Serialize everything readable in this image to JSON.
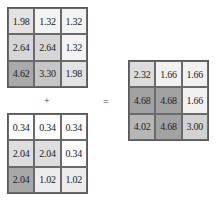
{
  "operands": {
    "plus": "+",
    "equals": "="
  },
  "matrix_a": {
    "rows": [
      [
        {
          "v": "1.98",
          "c": "#e3e3e3"
        },
        {
          "v": "1.32",
          "c": "#f3f3f3"
        },
        {
          "v": "1.32",
          "c": "#f3f3f3"
        }
      ],
      [
        {
          "v": "2.64",
          "c": "#d6d6d6"
        },
        {
          "v": "2.64",
          "c": "#d6d6d6"
        },
        {
          "v": "1.32",
          "c": "#f3f3f3"
        }
      ],
      [
        {
          "v": "4.62",
          "c": "#aaaaaa"
        },
        {
          "v": "3.30",
          "c": "#c6c6c6"
        },
        {
          "v": "1.98",
          "c": "#e3e3e3"
        }
      ]
    ]
  },
  "matrix_b": {
    "rows": [
      [
        {
          "v": "0.34",
          "c": "#fcfcfc"
        },
        {
          "v": "0.34",
          "c": "#fcfcfc"
        },
        {
          "v": "0.34",
          "c": "#fcfcfc"
        }
      ],
      [
        {
          "v": "2.04",
          "c": "#dedede"
        },
        {
          "v": "2.04",
          "c": "#dedede"
        },
        {
          "v": "0.34",
          "c": "#fcfcfc"
        }
      ],
      [
        {
          "v": "2.04",
          "c": "#a8a8a8"
        },
        {
          "v": "1.02",
          "c": "#ececec"
        },
        {
          "v": "1.02",
          "c": "#ececec"
        }
      ]
    ]
  },
  "matrix_sum": {
    "rows": [
      [
        {
          "v": "2.32",
          "c": "#dcdcdc"
        },
        {
          "v": "1.66",
          "c": "#f1f1f1"
        },
        {
          "v": "1.66",
          "c": "#f1f1f1"
        }
      ],
      [
        {
          "v": "4.68",
          "c": "#a2a2a2"
        },
        {
          "v": "4.68",
          "c": "#a2a2a2"
        },
        {
          "v": "1.66",
          "c": "#f1f1f1"
        }
      ],
      [
        {
          "v": "4.02",
          "c": "#b6b6b6"
        },
        {
          "v": "4.68",
          "c": "#a2a2a2"
        },
        {
          "v": "3.00",
          "c": "#d2d2d2"
        }
      ]
    ]
  }
}
